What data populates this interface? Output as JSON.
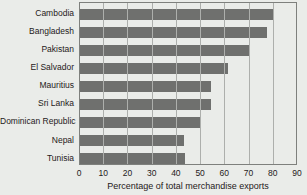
{
  "chart_data": {
    "type": "bar",
    "orientation": "horizontal",
    "title": "",
    "xlabel": "Percentage of total merchandise exports",
    "ylabel": "",
    "xlim": [
      0,
      90
    ],
    "xticks": [
      0,
      10,
      20,
      30,
      40,
      50,
      60,
      70,
      80,
      90
    ],
    "grid": "vertical",
    "legend": "none",
    "categories": [
      "Cambodia",
      "Bangladesh",
      "Pakistan",
      "El Salvador",
      "Mauritius",
      "Sri Lanka",
      "Dominican Republic",
      "Nepal",
      "Tunisia"
    ],
    "values": [
      80,
      77,
      70,
      61,
      54,
      54,
      50,
      43,
      43.5
    ],
    "colors": {
      "background": "#eaece9",
      "bar": "#6f706e",
      "gridline": "#adafac",
      "frame": "#7e807d",
      "text": "#1f2020"
    }
  }
}
